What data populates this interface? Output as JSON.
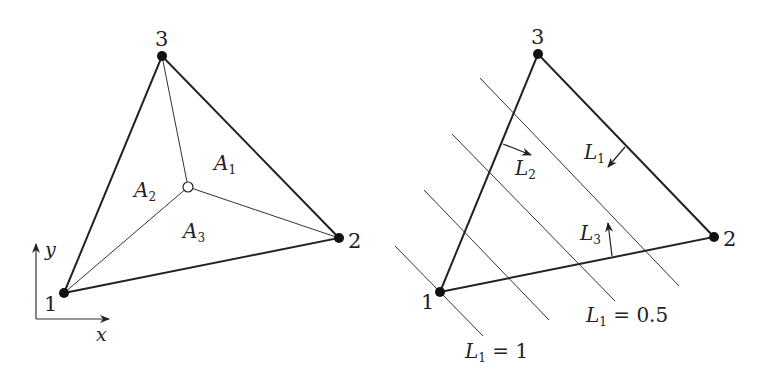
{
  "left_figure": {
    "nodes": [
      {
        "id": "1",
        "label": "1",
        "x": 64,
        "y": 293
      },
      {
        "id": "2",
        "label": "2",
        "x": 339,
        "y": 238
      },
      {
        "id": "3",
        "label": "3",
        "x": 162,
        "y": 56
      }
    ],
    "interior_point": {
      "x": 188,
      "y": 187
    },
    "areas": [
      {
        "main": "A",
        "sub": "1",
        "x": 214,
        "y": 170
      },
      {
        "main": "A",
        "sub": "2",
        "x": 134,
        "y": 197
      },
      {
        "main": "A",
        "sub": "3",
        "x": 183,
        "y": 238
      }
    ],
    "axes": {
      "x_label": "x",
      "y_label": "y"
    }
  },
  "right_figure": {
    "nodes": [
      {
        "id": "1",
        "label": "1",
        "x": 440,
        "y": 292
      },
      {
        "id": "2",
        "label": "2",
        "x": 714,
        "y": 237
      },
      {
        "id": "3",
        "label": "3",
        "x": 538,
        "y": 54
      }
    ],
    "arrow_labels": [
      {
        "main": "L",
        "sub": "1",
        "x": 584,
        "y": 159
      },
      {
        "main": "L",
        "sub": "2",
        "x": 515,
        "y": 175
      },
      {
        "main": "L",
        "sub": "3",
        "x": 580,
        "y": 240
      }
    ],
    "contour_labels": [
      {
        "main": "L",
        "sub": "1",
        "rest": " = 0.5",
        "x": 586,
        "y": 322
      },
      {
        "main": "L",
        "sub": "1",
        "rest": " = 1",
        "x": 465,
        "y": 358
      }
    ]
  }
}
